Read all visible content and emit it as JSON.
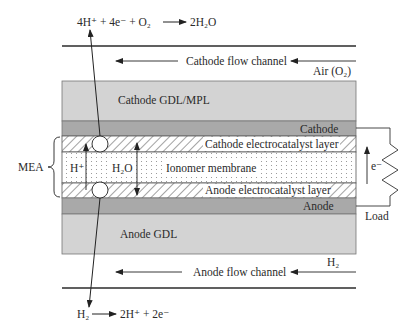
{
  "colors": {
    "gdl": "#d3d3d3",
    "electrode": "#a9a9a9",
    "line": "#2b2b2b",
    "hatch": "#555555",
    "dot": "#8a8a8a"
  },
  "top_reaction": {
    "lhs": "4H⁺ + 4e⁻ + O₂",
    "rhs": "2H₂O"
  },
  "bottom_reaction": {
    "lhs": "H₂",
    "rhs": "2H⁺ + 2e⁻"
  },
  "channels": {
    "cathode_label": "Cathode flow channel",
    "cathode_inlet": "Air (O₂)",
    "anode_label": "Anode flow channel",
    "anode_inlet": "H₂"
  },
  "layers": {
    "cathode_gdl": "Cathode GDL/MPL",
    "cathode": "Cathode",
    "cathode_catalyst": "Cathode electrocatalyst layer",
    "membrane": "Ionomer membrane",
    "anode_catalyst": "Anode electrocatalyst layer",
    "anode": "Anode",
    "anode_gdl": "Anode GDL"
  },
  "species": {
    "proton": "H⁺",
    "water": "H₂O",
    "electron": "e⁻"
  },
  "mea_label": "MEA",
  "load_label": "Load"
}
